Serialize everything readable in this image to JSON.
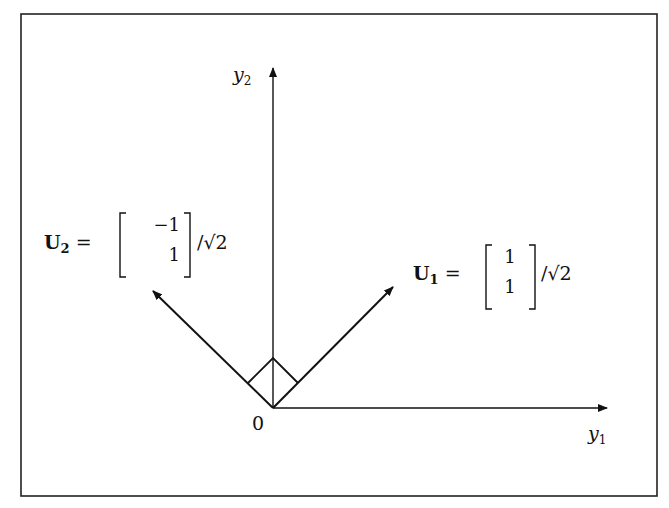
{
  "diagram": {
    "axes": {
      "x_label": {
        "base": "y",
        "sub": "1"
      },
      "y_label": {
        "base": "y",
        "sub": "2"
      },
      "origin_label": "0"
    },
    "vectors": [
      {
        "name": "U1",
        "label_base": "U",
        "label_sub": "1",
        "equals": "=",
        "entries": [
          "1",
          "1"
        ],
        "scale": "/√2",
        "direction": [
          1,
          1
        ]
      },
      {
        "name": "U2",
        "label_base": "U",
        "label_sub": "2",
        "equals": "=",
        "entries": [
          "−1",
          "1"
        ],
        "scale": "/√2",
        "direction": [
          -1,
          1
        ]
      }
    ],
    "right_angle_marker": true,
    "colors": {
      "ink": "#111111",
      "background": "#ffffff"
    }
  }
}
